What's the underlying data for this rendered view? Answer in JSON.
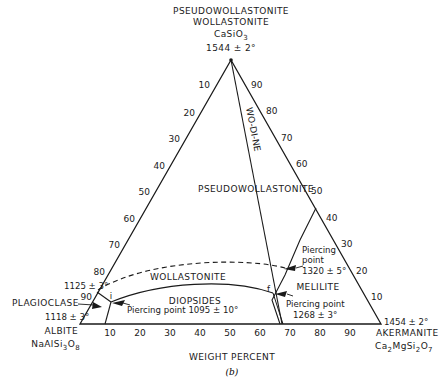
{
  "diagram": {
    "type": "ternary-phase-diagram",
    "caption": "(b)",
    "axis_label": "WEIGHT PERCENT",
    "vertices": {
      "top": {
        "names": [
          "PSEUDOWOLLASTONITE",
          "WOLLASTONITE"
        ],
        "formula": "CaSiO3",
        "temperature": "1544 ± 2°"
      },
      "left": {
        "name": "ALBITE",
        "formula": "NaAlSi3O8",
        "temperature": "1118 ± 3°",
        "extra_label": "PLAGIOCLASE"
      },
      "right": {
        "name": "AKERMANITE",
        "formula": "Ca2MgSi2O7",
        "temperature": "1454 ± 2°"
      }
    },
    "left_edge_temp": "1125 ± 3°",
    "join_label": "WO-DI-NE",
    "fields": [
      "PSEUDOWOLLASTONITE",
      "WOLLASTONITE",
      "DIOPSIDES",
      "MELILITE"
    ],
    "points": [
      {
        "id": "i",
        "label": "i",
        "annotation": "Piercing point 1095 ± 10°"
      },
      {
        "id": "f",
        "label": "f",
        "annotation_line1": "Piercing point",
        "annotation_line2": "1268 ± 3°"
      },
      {
        "id": "p1320",
        "annotation_line1": "Piercing",
        "annotation_line2": "point",
        "annotation_line3": "1320 ± 5°"
      }
    ],
    "ticks": {
      "left": [
        "10",
        "20",
        "30",
        "40",
        "50",
        "60",
        "70",
        "80",
        "90"
      ],
      "right": [
        "90",
        "80",
        "70",
        "60",
        "50",
        "40",
        "30",
        "20",
        "10"
      ],
      "bottom": [
        "10",
        "20",
        "30",
        "40",
        "50",
        "60",
        "70",
        "80",
        "90"
      ]
    }
  }
}
